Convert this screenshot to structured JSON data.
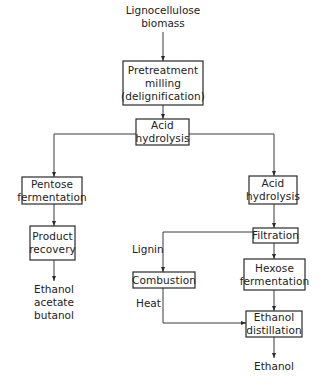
{
  "diagram": {
    "type": "process-flowchart",
    "colors": {
      "line": "#3a3a3a",
      "box_border": "#2a2a2a",
      "text": "#222222",
      "background": "#ffffff"
    },
    "input": {
      "line1": "Lignocellulose",
      "line2": "biomass"
    },
    "nodes": {
      "pretreatment": {
        "line1": "Pretreatment",
        "line2": "milling",
        "line3": "(delignification)"
      },
      "acid_hydrolysis_1": {
        "line1": "Acid",
        "line2": "hydrolysis"
      },
      "pentose_fermentation": {
        "line1": "Pentose",
        "line2": "fermentation"
      },
      "product_recovery": {
        "line1": "Product",
        "line2": "recovery"
      },
      "acid_hydrolysis_2": {
        "line1": "Acid",
        "line2": "hydrolysis"
      },
      "filtration": {
        "line1": "Filtration"
      },
      "combustion": {
        "line1": "Combustion"
      },
      "hexose_fermentation": {
        "line1": "Hexose",
        "line2": "fermentation"
      },
      "ethanol_distillation": {
        "line1": "Ethanol",
        "line2": "distillation"
      }
    },
    "outputs": {
      "pentose_products": {
        "line1": "Ethanol",
        "line2": "acetate",
        "line3": "butanol"
      },
      "final_product": {
        "line1": "Ethanol"
      }
    },
    "edge_labels": {
      "lignin": "Lignin",
      "heat": "Heat"
    },
    "edges": [
      [
        "Lignocellulose biomass",
        "Pretreatment milling (delignification)"
      ],
      [
        "Pretreatment milling (delignification)",
        "Acid hydrolysis"
      ],
      [
        "Acid hydrolysis",
        "Pentose fermentation"
      ],
      [
        "Acid hydrolysis",
        "Acid hydrolysis (2)"
      ],
      [
        "Pentose fermentation",
        "Product recovery"
      ],
      [
        "Product recovery",
        "Ethanol acetate butanol"
      ],
      [
        "Acid hydrolysis (2)",
        "Filtration"
      ],
      [
        "Filtration",
        "Combustion",
        "Lignin"
      ],
      [
        "Filtration",
        "Hexose fermentation"
      ],
      [
        "Combustion",
        "Ethanol distillation",
        "Heat"
      ],
      [
        "Hexose fermentation",
        "Ethanol distillation"
      ],
      [
        "Ethanol distillation",
        "Ethanol"
      ]
    ]
  }
}
